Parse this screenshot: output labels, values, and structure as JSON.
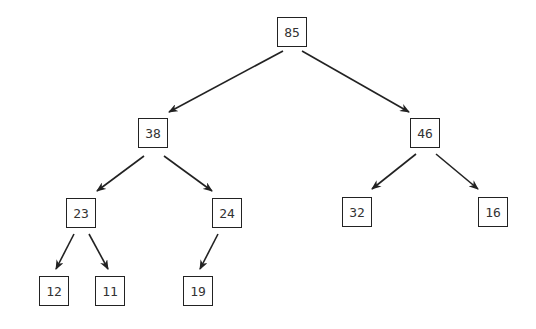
{
  "diagram": {
    "type": "binary-tree",
    "colors": {
      "stroke": "#222222",
      "text": "#333333",
      "background": "#ffffff"
    },
    "nodes": [
      {
        "id": "n85",
        "label": "85",
        "x": 277,
        "y": 17
      },
      {
        "id": "n38",
        "label": "38",
        "x": 138,
        "y": 118
      },
      {
        "id": "n46",
        "label": "46",
        "x": 410,
        "y": 118
      },
      {
        "id": "n23",
        "label": "23",
        "x": 66,
        "y": 198
      },
      {
        "id": "n24",
        "label": "24",
        "x": 212,
        "y": 198
      },
      {
        "id": "n32",
        "label": "32",
        "x": 342,
        "y": 197
      },
      {
        "id": "n16",
        "label": "16",
        "x": 478,
        "y": 197
      },
      {
        "id": "n12",
        "label": "12",
        "x": 39,
        "y": 276
      },
      {
        "id": "n11",
        "label": "11",
        "x": 95,
        "y": 276
      },
      {
        "id": "n19",
        "label": "19",
        "x": 183,
        "y": 276
      }
    ],
    "edges": [
      {
        "from": "85",
        "to": "38",
        "x1": 283,
        "y1": 51,
        "x2": 169,
        "y2": 112
      },
      {
        "from": "85",
        "to": "46",
        "x1": 302,
        "y1": 51,
        "x2": 409,
        "y2": 112
      },
      {
        "from": "38",
        "to": "23",
        "x1": 144,
        "y1": 156,
        "x2": 97,
        "y2": 191
      },
      {
        "from": "38",
        "to": "24",
        "x1": 164,
        "y1": 156,
        "x2": 212,
        "y2": 191
      },
      {
        "from": "46",
        "to": "32",
        "x1": 416,
        "y1": 154,
        "x2": 372,
        "y2": 189
      },
      {
        "from": "46",
        "to": "16",
        "x1": 436,
        "y1": 154,
        "x2": 478,
        "y2": 189
      },
      {
        "from": "23",
        "to": "12",
        "x1": 74,
        "y1": 234,
        "x2": 56,
        "y2": 269
      },
      {
        "from": "23",
        "to": "11",
        "x1": 89,
        "y1": 234,
        "x2": 108,
        "y2": 269
      },
      {
        "from": "24",
        "to": "19",
        "x1": 218,
        "y1": 234,
        "x2": 200,
        "y2": 269
      }
    ]
  }
}
